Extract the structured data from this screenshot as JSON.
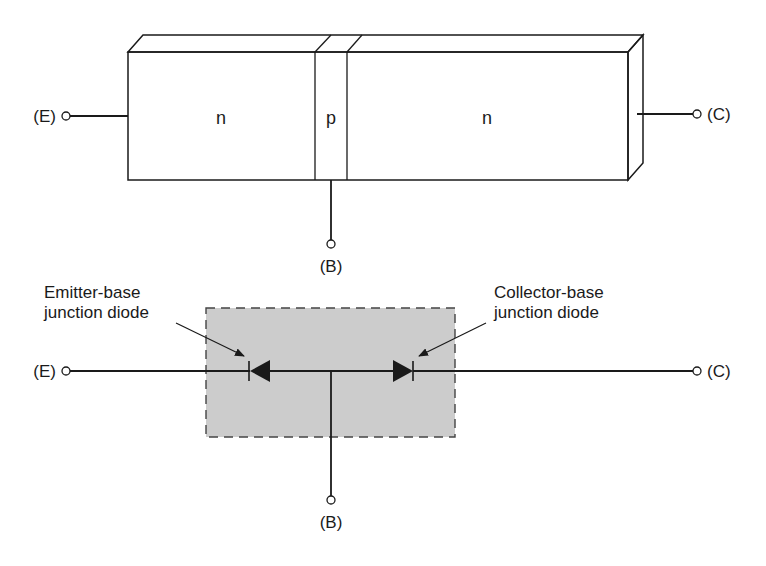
{
  "colors": {
    "ink": "#1a1a1a",
    "background": "#ffffff",
    "junction_box_fill": "#cccccc",
    "junction_box_border": "#444444"
  },
  "structure_diagram": {
    "regions": [
      {
        "label": "n",
        "role": "emitter"
      },
      {
        "label": "p",
        "role": "base"
      },
      {
        "label": "n",
        "role": "collector"
      }
    ],
    "terminals": {
      "emitter": "(E)",
      "collector": "(C)",
      "base": "(B)"
    }
  },
  "diode_diagram": {
    "terminals": {
      "emitter": "(E)",
      "collector": "(C)",
      "base": "(B)"
    },
    "annotations": {
      "emitter_base": {
        "line1": "Emitter-base",
        "line2": "junction diode"
      },
      "collector_base": {
        "line1": "Collector-base",
        "line2": "junction diode"
      }
    }
  }
}
